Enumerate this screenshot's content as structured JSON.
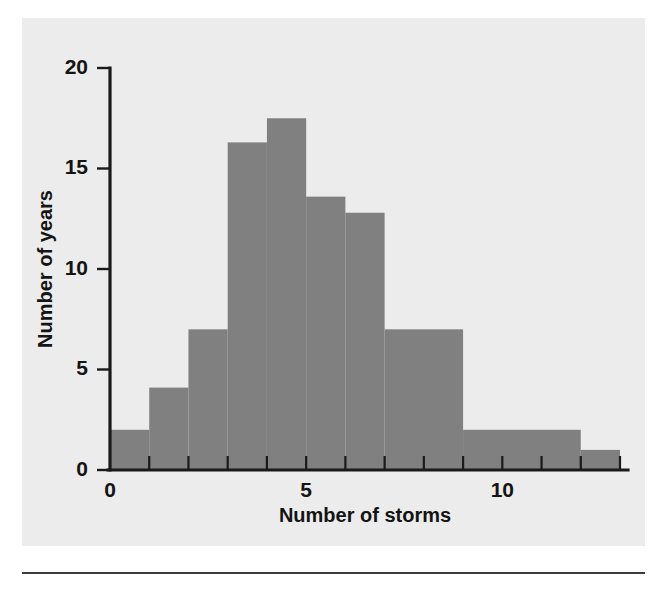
{
  "figure": {
    "background_color": "#ececec",
    "page_background_color": "#ffffff",
    "rule_color": "#3c3c3c"
  },
  "chart_data": {
    "type": "bar",
    "title": "",
    "subtitle": "",
    "xlabel": "Number of storms",
    "ylabel": "Number of years",
    "xlim": [
      0,
      13
    ],
    "ylim": [
      0,
      20
    ],
    "grid": false,
    "legend": null,
    "legend_position": "none",
    "bar_color": "#808080",
    "axis_color": "#1a1a1a",
    "x_ticks_major": [
      0,
      5,
      10
    ],
    "x_tick_labels_major": [
      "0",
      "5",
      "10"
    ],
    "x_ticks_minor": [
      1,
      2,
      3,
      4,
      6,
      7,
      8,
      9,
      11,
      12,
      13
    ],
    "y_ticks": [
      0,
      5,
      10,
      15,
      20
    ],
    "y_tick_labels": [
      "0",
      "5",
      "10",
      "15",
      "20"
    ],
    "bin_edges": [
      0,
      1,
      2,
      3,
      4,
      5,
      6,
      7,
      9,
      12,
      13
    ],
    "categories": [
      "0-1",
      "1-2",
      "2-3",
      "3-4",
      "4-5",
      "5-6",
      "6-7",
      "7-9",
      "9-12",
      "12-13"
    ],
    "values": [
      2,
      4.1,
      7,
      16.3,
      17.5,
      13.6,
      12.8,
      7,
      2,
      1
    ],
    "bars": [
      {
        "x0": 0,
        "x1": 1,
        "height": 2
      },
      {
        "x0": 1,
        "x1": 2,
        "height": 4.1
      },
      {
        "x0": 2,
        "x1": 3,
        "height": 7
      },
      {
        "x0": 3,
        "x1": 4,
        "height": 16.3
      },
      {
        "x0": 4,
        "x1": 5,
        "height": 17.5
      },
      {
        "x0": 5,
        "x1": 6,
        "height": 13.6
      },
      {
        "x0": 6,
        "x1": 7,
        "height": 12.8
      },
      {
        "x0": 7,
        "x1": 9,
        "height": 7
      },
      {
        "x0": 9,
        "x1": 12,
        "height": 2
      },
      {
        "x0": 12,
        "x1": 13,
        "height": 1
      }
    ]
  }
}
